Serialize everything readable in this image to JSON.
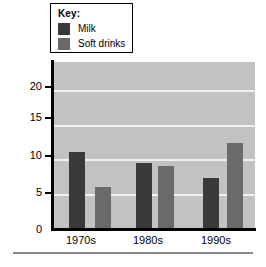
{
  "legend": {
    "title": "Key:",
    "entries": [
      {
        "label": "Milk",
        "color": "#3a3a3a"
      },
      {
        "label": "Soft drinks",
        "color": "#6a6a6a"
      }
    ]
  },
  "axis": {
    "y_title": "Ounces",
    "y_ticks": [
      "20",
      "15",
      "10",
      "5",
      "0"
    ],
    "x_ticks": [
      "1970s",
      "1980s",
      "1990s"
    ]
  },
  "chart_data": {
    "type": "bar",
    "title": "",
    "xlabel": "",
    "ylabel": "Ounces",
    "categories": [
      "1970s",
      "1980s",
      "1990s"
    ],
    "series": [
      {
        "name": "Milk",
        "color": "#3a3a3a",
        "values": [
          11,
          9.5,
          7.3
        ]
      },
      {
        "name": "Soft drinks",
        "color": "#6a6a6a",
        "values": [
          6.1,
          9,
          12.4
        ]
      }
    ],
    "ylim": [
      0,
      24
    ],
    "yticks": [
      0,
      5,
      10,
      15,
      20
    ],
    "gridlines": true,
    "grid_axis": "y",
    "legend_position": "above-left",
    "plot_background": "#c2c2c2",
    "gridline_color": "#f2f2f2"
  }
}
